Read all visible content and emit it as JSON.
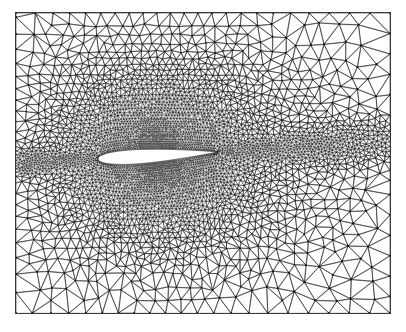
{
  "figure": {
    "type": "cfd-unstructured-mesh",
    "title": "",
    "caption": "",
    "width": 406,
    "height": 332,
    "background_color": "#ffffff"
  },
  "domain_frame": {
    "name": "computational-domain-boundary",
    "x0": 16,
    "y0": 13,
    "x1": 390,
    "y1": 313,
    "stroke_color": "#3a3a3a",
    "stroke_width": 1.0
  },
  "mesh": {
    "element_type": "triangle",
    "edge_color": "#2b2b2b",
    "node_color": "#111111",
    "node_radius_far": 1.05,
    "node_radius_near": 0.0,
    "edge_width_far": 0.6,
    "edge_width_near": 0.28,
    "refinement": "anisotropic, clustered at airfoil surface and wake",
    "spacing_far_field": 17.0,
    "spacing_near_body": 1.35,
    "spacing_wake": 2.2,
    "wake_half_width": 34,
    "wake_growth": 0.55,
    "corner_spacing": 19.0
  },
  "airfoil": {
    "name": "airfoil-body",
    "profile": "NACA-4-digit symmetric",
    "fill_color": "#ffffff",
    "outline_color": "#2b2b2b",
    "leading_edge_x": 98,
    "leading_edge_y": 159,
    "trailing_edge_x": 217,
    "trailing_edge_y": 152,
    "chord_px": 119,
    "thickness_ratio": 0.12,
    "angle_of_attack_deg": 3.4
  },
  "chart_data": {
    "type": "mesh",
    "xlabel": "",
    "ylabel": "",
    "legend": [],
    "annotations": [],
    "grid": true,
    "regions": [
      {
        "label": "far-field",
        "density": "coarse",
        "relative_spacing": 1.0
      },
      {
        "label": "intermediate",
        "density": "medium",
        "relative_spacing": 0.35
      },
      {
        "label": "boundary-layer",
        "density": "very fine",
        "relative_spacing": 0.08
      },
      {
        "label": "wake",
        "density": "fine",
        "relative_spacing": 0.13
      }
    ]
  }
}
